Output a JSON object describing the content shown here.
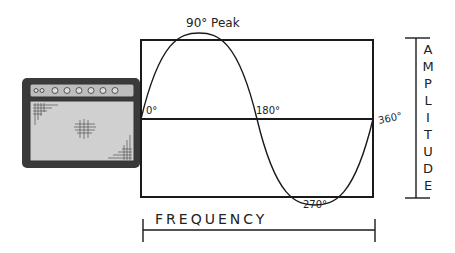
{
  "diagram": {
    "labels": {
      "peak": "90° Peak",
      "start": "0°",
      "mid": "180°",
      "end": "360°",
      "trough": "270°",
      "x_axis": "FREQUENCY",
      "y_axis_letters": [
        "A",
        "M",
        "P",
        "L",
        "I",
        "T",
        "U",
        "D",
        "E"
      ]
    },
    "icons": {
      "amplifier": "guitar-amplifier-icon"
    },
    "colors": {
      "line": "#1a1a1a",
      "amp_body": "#3a3a3a",
      "amp_panel": "#bdbdbd",
      "amp_grille": "#d0d0d0",
      "background": "#ffffff"
    }
  }
}
